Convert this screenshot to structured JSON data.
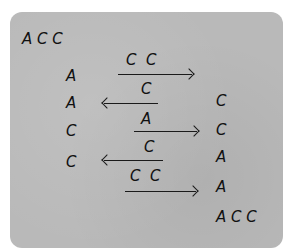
{
  "diagram": {
    "header_sequence": "A C C",
    "left_column": [
      "A",
      "A",
      "C",
      "C"
    ],
    "right_column": [
      "C",
      "C",
      "A",
      "A",
      "A C C"
    ],
    "arrows": [
      {
        "label": "C  C",
        "direction": "right"
      },
      {
        "label": "C",
        "direction": "left"
      },
      {
        "label": "A",
        "direction": "right"
      },
      {
        "label": "C",
        "direction": "left"
      },
      {
        "label": "C  C",
        "direction": "right"
      }
    ],
    "colors": {
      "background": "#b9b9b9",
      "ink": "#111111"
    }
  }
}
